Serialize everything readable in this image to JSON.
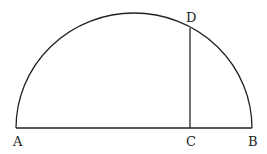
{
  "diagram": {
    "type": "semicircle-geometry",
    "points": {
      "A": {
        "label": "A",
        "x": 16,
        "y": 128
      },
      "B": {
        "label": "B",
        "x": 252,
        "y": 128
      },
      "C": {
        "label": "C",
        "x": 190,
        "y": 128
      },
      "D": {
        "label": "D",
        "x": 190,
        "y": 28
      }
    },
    "labels": {
      "A": "A",
      "B": "B",
      "C": "C",
      "D": "D"
    },
    "colors": {
      "stroke": "#222222",
      "background": "#ffffff"
    }
  }
}
